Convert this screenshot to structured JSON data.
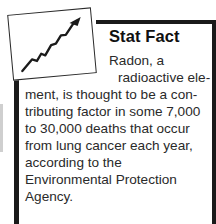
{
  "callout": {
    "title": "Stat Fact",
    "icon_name": "rising-trend-chart-icon",
    "colors": {
      "rule": "#1a1a1a",
      "title": "#101010",
      "body": "#2a2a2a",
      "card_border": "#2b2b2b",
      "background": "#ffffff"
    },
    "body_lines": [
      {
        "text": "Radon, a",
        "indent": "indent-1"
      },
      {
        "text": "radioactive ele-",
        "indent": "indent-2"
      },
      {
        "text": "ment, is thought to be a con-",
        "indent": "indent-full"
      },
      {
        "text": "tributing factor in some 7,000",
        "indent": "indent-full"
      },
      {
        "text": "to 30,000 deaths that occur",
        "indent": "indent-full"
      },
      {
        "text": "from lung cancer each year,",
        "indent": "indent-full"
      },
      {
        "text": "according to the",
        "indent": "indent-full"
      },
      {
        "text": "Environmental Protection",
        "indent": "indent-full"
      },
      {
        "text": "Agency.",
        "indent": "indent-full"
      }
    ],
    "body_text": "Radon, a radioactive element, is thought to be a contributing factor in some 7,000 to 30,000 deaths that occur from lung cancer each year, according to the Environmental Protection Agency."
  }
}
